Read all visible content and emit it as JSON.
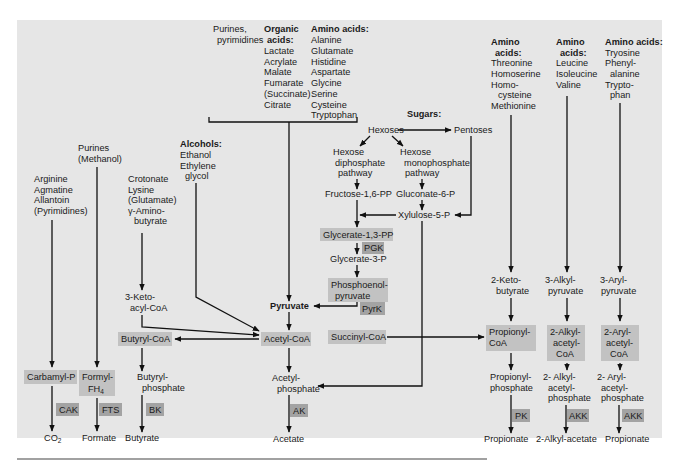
{
  "sources": {
    "purines_pyrimidines": [
      "Purines,",
      "pyrimidines"
    ],
    "organic_acids": {
      "title": [
        "Organic",
        "acids:"
      ],
      "items": [
        "Lactate",
        "Acrylate",
        "Malate",
        "Fumarate",
        "(Succinate)",
        "Citrate"
      ]
    },
    "amino_acids_1": {
      "title": "Amino acids:",
      "items": [
        "Alanine",
        "Glutamate",
        "Histidine",
        "Aspartate",
        "Glycine",
        "Serine",
        "Cysteine",
        "Tryptophan"
      ]
    },
    "amino_acids_2": {
      "title": [
        "Amino",
        "acids:"
      ],
      "items": [
        "Threonine",
        "Homoserine",
        "Homo-",
        "cysteine",
        "Methionine"
      ]
    },
    "amino_acids_3": {
      "title": [
        "Amino",
        "acids:"
      ],
      "items": [
        "Leucine",
        "Isoleucine",
        "Valine"
      ]
    },
    "amino_acids_4": {
      "title": "Amino acids:",
      "items": [
        "Tryosine",
        "Phenyl-",
        "alanine",
        "Trypto-",
        "phan"
      ]
    },
    "sugars": {
      "title": "Sugars:"
    },
    "alcohols": {
      "title": "Alcohols:",
      "items": [
        "Ethanol",
        "Ethylene",
        "glycol"
      ]
    },
    "purines_methanol": [
      "Purines",
      "(Methanol)"
    ],
    "arginine_group": [
      "Arginine",
      "Agmatine",
      "Allantoin",
      "(Pyrimidines)"
    ],
    "crotonate_group": [
      "Crotonate",
      "Lysine",
      "(Glutamate)",
      "γ-Amino-",
      "butyrate"
    ]
  },
  "sugar_pathway": {
    "hexoses": "Hexoses",
    "pentoses": "Pentoses",
    "hexose_diphosphate": [
      "Hexose",
      "diphosphate",
      "pathway"
    ],
    "hexose_monophosphate": [
      "Hexose",
      "monophosphate",
      "pathway"
    ],
    "fructose_16pp": "Fructose-1,6-PP",
    "gluconate_6p": "Gluconate-6-P",
    "xylulose_5p": "Xylulose-5-P",
    "glycerate_13pp": "Glycerate-1,3-PP",
    "glycerate_3p": "Glycerate-3-P",
    "phosphoenolpyruvate": [
      "Phosphoenol-",
      "pyruvate"
    ],
    "pyruvate": "Pyruvate"
  },
  "intermediates": {
    "keto_acyl_coa": [
      "3-Keto-",
      "acyl-CoA"
    ],
    "butyryl_coa": "Butyryl-CoA",
    "acetyl_coa": "Acetyl-CoA",
    "succinyl_coa": "Succinyl-CoA",
    "carbamyl_p": "Carbamyl-P",
    "formyl_fh4": [
      "Formyl-",
      "FH",
      "4"
    ],
    "butyryl_phosphate": [
      "Butyryl-",
      "phosphate"
    ],
    "acetyl_phosphate": [
      "Acetyl-",
      "phosphate"
    ],
    "keto_butyrate": [
      "2-Keto-",
      "butyrate"
    ],
    "alkyl_pyruvate": [
      "3-Alkyl-",
      "pyruvate"
    ],
    "aryl_pyruvate": [
      "3-Aryl-",
      "pyruvate"
    ],
    "propionyl_coa": [
      "Propionyl-",
      "CoA"
    ],
    "alkyl_acetyl_coa": [
      "2-Alkyl-",
      "acetyl-",
      "CoA"
    ],
    "aryl_acetyl_coa": [
      "2-Aryl-",
      "acetyl-",
      "CoA"
    ],
    "propionyl_phosphate": [
      "Propionyl-",
      "phosphate"
    ],
    "alkyl_acetyl_phosphate": [
      "2- Alkyl-",
      "acetyl-",
      "phosphate"
    ],
    "aryl_acetyl_phosphate": [
      "2- Aryl-",
      "acetyl-",
      "phosphate"
    ]
  },
  "enzymes": {
    "pgk": "PGK",
    "pyrk": "PyrK",
    "cak": "CAK",
    "fts": "FTS",
    "bk": "BK",
    "ak": "AK",
    "pk": "PK",
    "akk_1": "AKK",
    "akk_2": "AKK"
  },
  "products": {
    "co2": [
      "CO",
      "2"
    ],
    "formate": "Formate",
    "butyrate": "Butyrate",
    "acetate": "Acetate",
    "propionate_1": "Propionate",
    "alkyl_acetate": "2-Alkyl-acetate",
    "propionate_2": "Propionate"
  },
  "colors": {
    "panel_background": "#e6e6e6",
    "intermediate_box": "#c2c2c2",
    "enzyme_box": "#a3a3a3",
    "line": "#111111",
    "text": "#1a1a1a"
  }
}
